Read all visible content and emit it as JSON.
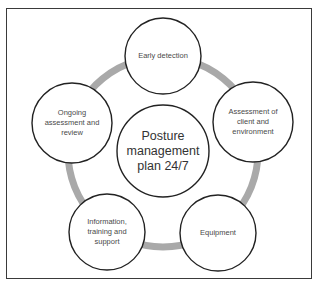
{
  "diagram": {
    "center": {
      "label": "Posture\nmanagement\nplan 24/7"
    },
    "nodes": [
      {
        "id": "early-detection",
        "label": "Early detection"
      },
      {
        "id": "assessment-client-environment",
        "label": "Assessment of\nclient and\nenvironment"
      },
      {
        "id": "equipment",
        "label": "Equipment"
      },
      {
        "id": "information-training-support",
        "label": "Information,\ntraining and\nsupport"
      },
      {
        "id": "ongoing-assessment-review",
        "label": "Ongoing\nassessment and\nreview"
      }
    ],
    "colors": {
      "ring": "#a9a9a9",
      "circle_stroke": "#222222",
      "circle_fill": "#ffffff",
      "frame": "#3a3a3a",
      "text": "#4a4a4a"
    }
  }
}
